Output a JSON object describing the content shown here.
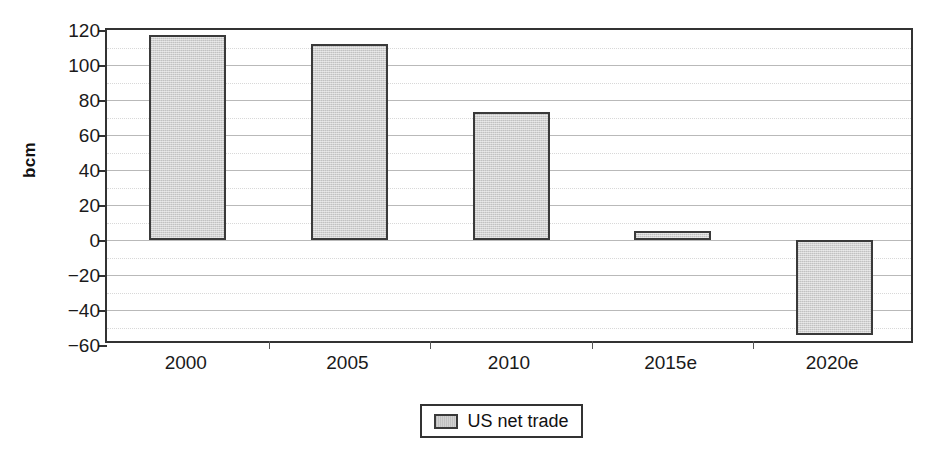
{
  "chart_data": {
    "type": "bar",
    "title": "",
    "xlabel": "",
    "ylabel": "bcm",
    "categories": [
      "2000",
      "2005",
      "2010",
      "2015e",
      "2020e"
    ],
    "series": [
      {
        "name": "US net trade",
        "values": [
          117,
          112,
          73,
          5,
          -54
        ]
      }
    ],
    "ylim": [
      -60,
      120
    ],
    "ytick_labels": [
      "120",
      "100",
      "80",
      "60",
      "40",
      "20",
      "0",
      "−20",
      "−40",
      "−60"
    ],
    "ytick_values": [
      120,
      100,
      80,
      60,
      40,
      20,
      0,
      -20,
      -40,
      -60
    ],
    "grid": true,
    "minor_grid": true,
    "legend": {
      "position": "bottom-center",
      "entries": [
        {
          "label": "US net trade",
          "color": "#d2d2d2"
        }
      ]
    },
    "colors": {
      "bar_fill": "#d2d2d2",
      "bar_border": "#3a3a3a",
      "axis": "#333333",
      "gridline": "#b9b9b9",
      "minor_gridline": "#d8d8d8",
      "text": "#1a1a1a",
      "background": "#ffffff"
    }
  }
}
